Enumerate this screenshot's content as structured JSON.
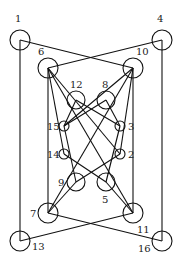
{
  "diagram": {
    "type": "graph",
    "colors": {
      "stroke": "#111111",
      "label": "#222222",
      "background": "#ffffff"
    },
    "nodes": [
      {
        "id": "1",
        "x": 20,
        "y": 40,
        "r": 10,
        "lx": 15,
        "ly": 22
      },
      {
        "id": "4",
        "x": 162,
        "y": 40,
        "r": 10,
        "lx": 157,
        "ly": 22
      },
      {
        "id": "6",
        "x": 48,
        "y": 68,
        "r": 10,
        "lx": 38,
        "ly": 55
      },
      {
        "id": "10",
        "x": 133,
        "y": 68,
        "r": 10,
        "lx": 136,
        "ly": 55
      },
      {
        "id": "12",
        "x": 76,
        "y": 100,
        "r": 9,
        "lx": 70,
        "ly": 88
      },
      {
        "id": "8",
        "x": 106,
        "y": 100,
        "r": 9,
        "lx": 102,
        "ly": 88
      },
      {
        "id": "15",
        "x": 64,
        "y": 126,
        "r": 5,
        "lx": 47,
        "ly": 130
      },
      {
        "id": "3",
        "x": 120,
        "y": 126,
        "r": 5,
        "lx": 128,
        "ly": 130
      },
      {
        "id": "14",
        "x": 64,
        "y": 154,
        "r": 5,
        "lx": 47,
        "ly": 158
      },
      {
        "id": "2",
        "x": 120,
        "y": 154,
        "r": 5,
        "lx": 128,
        "ly": 158
      },
      {
        "id": "9",
        "x": 76,
        "y": 182,
        "r": 9,
        "lx": 58,
        "ly": 186
      },
      {
        "id": "5",
        "x": 106,
        "y": 182,
        "r": 9,
        "lx": 102,
        "ly": 203
      },
      {
        "id": "7",
        "x": 48,
        "y": 213,
        "r": 10,
        "lx": 30,
        "ly": 217
      },
      {
        "id": "11",
        "x": 133,
        "y": 213,
        "r": 10,
        "lx": 137,
        "ly": 233
      },
      {
        "id": "13",
        "x": 20,
        "y": 241,
        "r": 10,
        "lx": 32,
        "ly": 250
      },
      {
        "id": "16",
        "x": 162,
        "y": 241,
        "r": 10,
        "lx": 138,
        "ly": 252
      }
    ],
    "edges": [
      [
        "1",
        "10"
      ],
      [
        "1",
        "13"
      ],
      [
        "4",
        "6"
      ],
      [
        "4",
        "16"
      ],
      [
        "6",
        "7"
      ],
      [
        "6",
        "14"
      ],
      [
        "6",
        "2"
      ],
      [
        "10",
        "11"
      ],
      [
        "10",
        "2"
      ],
      [
        "10",
        "15"
      ],
      [
        "12",
        "15"
      ],
      [
        "12",
        "3"
      ],
      [
        "8",
        "3"
      ],
      [
        "8",
        "15"
      ],
      [
        "15",
        "9"
      ],
      [
        "3",
        "5"
      ],
      [
        "14",
        "5"
      ],
      [
        "2",
        "9"
      ],
      [
        "9",
        "7"
      ],
      [
        "5",
        "11"
      ],
      [
        "7",
        "16"
      ],
      [
        "11",
        "13"
      ],
      [
        "6",
        "11"
      ],
      [
        "10",
        "7"
      ]
    ]
  }
}
